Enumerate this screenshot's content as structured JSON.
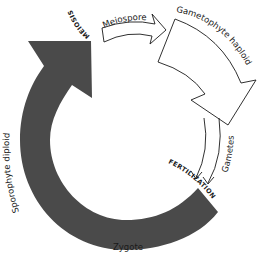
{
  "diagram": {
    "type": "life-cycle",
    "colors": {
      "background": "#ffffff",
      "sporophyte_arrow": "#4a4a4a",
      "outline": "#1a1a1a",
      "text": "#1a1a1a"
    },
    "labels": {
      "meiosis": "MEIOSIS",
      "meiospore": "Meiospore",
      "gametophyte": "Gametophyte haploid",
      "gametes": "Gametes",
      "fertilization": "FERTILIZATION",
      "zygote": "Zygote",
      "sporophyte": "Sporophyte diploid"
    },
    "nodes": [
      {
        "id": "sporophyte",
        "label": "Sporophyte diploid",
        "style": "dark-filled-arrow"
      },
      {
        "id": "meiosis",
        "label": "MEIOSIS",
        "style": "event"
      },
      {
        "id": "meiospore",
        "label": "Meiospore",
        "style": "outlined-arrow"
      },
      {
        "id": "gametophyte",
        "label": "Gametophyte haploid",
        "style": "outlined-arrow"
      },
      {
        "id": "gametes",
        "label": "Gametes",
        "style": "double-line-arrow"
      },
      {
        "id": "fertilization",
        "label": "FERTILIZATION",
        "style": "event"
      },
      {
        "id": "zygote",
        "label": "Zygote",
        "style": "stage"
      }
    ],
    "edges": [
      {
        "from": "sporophyte",
        "to": "meiosis"
      },
      {
        "from": "meiosis",
        "to": "meiospore"
      },
      {
        "from": "meiospore",
        "to": "gametophyte"
      },
      {
        "from": "gametophyte",
        "to": "gametes"
      },
      {
        "from": "gametes",
        "to": "fertilization"
      },
      {
        "from": "fertilization",
        "to": "zygote"
      },
      {
        "from": "zygote",
        "to": "sporophyte"
      }
    ]
  }
}
